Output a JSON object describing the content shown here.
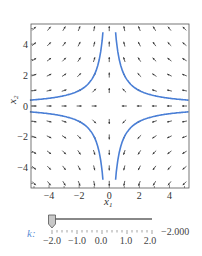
{
  "chart_data": {
    "type": "vector_field_with_curves",
    "title": "",
    "xlabel": "x1",
    "ylabel": "x2",
    "xlim": [
      -5.2,
      5.3
    ],
    "ylim": [
      -5.3,
      5.3
    ],
    "xticks": [
      -4,
      -2,
      0,
      2,
      4
    ],
    "yticks": [
      -4,
      -2,
      0,
      2,
      4
    ],
    "xtick_labels": [
      "−4",
      "−2",
      "0",
      "2",
      "4"
    ],
    "ytick_labels": [
      "−4",
      "−2",
      "0",
      "2",
      "4"
    ],
    "grid": false,
    "vector_field": {
      "dx1": "-x1",
      "dx2": "x2",
      "grid_step": 1,
      "arrow_color": "#333333"
    },
    "curves": [
      {
        "name": "branch-top-left",
        "relation": "x1*x2 = -2",
        "quadrant": "II",
        "color": "#4a7fd6"
      },
      {
        "name": "branch-top-right",
        "relation": "x1*x2 = 2",
        "quadrant": "I",
        "color": "#4a7fd6"
      },
      {
        "name": "branch-bottom-left",
        "relation": "x1*x2 = 2",
        "quadrant": "III",
        "color": "#4a7fd6"
      },
      {
        "name": "branch-bottom-right",
        "relation": "x1*x2 = -2",
        "quadrant": "IV",
        "color": "#4a7fd6"
      }
    ],
    "curve_constant": 2
  },
  "axes": {
    "xlabel": "x",
    "xlabel_sub": "1",
    "ylabel": "x",
    "ylabel_sub": "2"
  },
  "slider": {
    "label": "k:",
    "value": -2.0,
    "value_text": "−2.000",
    "min": -2.0,
    "max": 2.0,
    "tick_labels": [
      "−2.0",
      "−1.0",
      "0.0",
      "1.0",
      "2.0"
    ],
    "accent_color": "#5b8fd6"
  }
}
